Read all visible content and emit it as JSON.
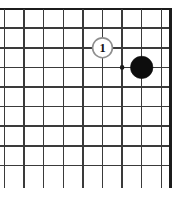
{
  "figure": {
    "kind": "go-board-diagram",
    "background_color": "#ffffff",
    "line_color": "#3a3a3a",
    "border_color": "#1c1c1c",
    "black_stone_color": "#0d0d0d",
    "white_stone_color": "#ffffff",
    "white_stone_outline_color": "#8e8e8e",
    "label_color": "#111111"
  },
  "board": {
    "crop": {
      "top_edge_visible": true,
      "right_edge_visible": true,
      "left_edge_visible": false,
      "bottom_edge_visible": false
    },
    "spacing_px": 19.6,
    "horizontal_lines_y": [
      9,
      28.2,
      47.8,
      67.4,
      87,
      106.6,
      126.2,
      145.8,
      165.4
    ],
    "vertical_lines_x": [
      4.5,
      24.1,
      43.7,
      63.3,
      82.9,
      102.5,
      122.1,
      141.7,
      161.3,
      170.5
    ],
    "vertical_line_top_y": 9,
    "vertical_line_bottom_y": 188,
    "horizontal_line_left_x": 0,
    "horizontal_line_right_x": 170.5
  },
  "star_points": [
    {
      "name": "hoshi",
      "cx": 122.1,
      "cy": 67.4,
      "r": 2.3
    }
  ],
  "stones": [
    {
      "name": "black-stone",
      "color": "black",
      "cx": 141.7,
      "cy": 67.4,
      "r": 11.2,
      "label": ""
    },
    {
      "name": "white-stone-move-1",
      "color": "white",
      "cx": 102.5,
      "cy": 47.8,
      "r": 9.9,
      "label": "1"
    }
  ],
  "labels": {
    "move_one": "1"
  }
}
